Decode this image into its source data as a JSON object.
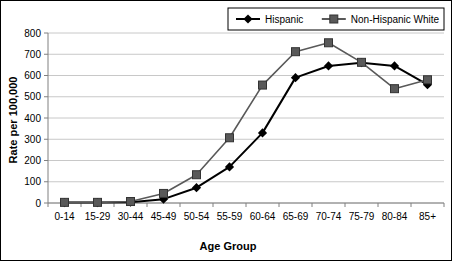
{
  "chart_data": {
    "type": "line",
    "title": "",
    "xlabel": "Age Group",
    "ylabel": "Rate per 100,000",
    "categories": [
      "0-14",
      "15-29",
      "30-44",
      "45-49",
      "50-54",
      "55-59",
      "60-64",
      "65-69",
      "70-74",
      "75-79",
      "80-84",
      "85+"
    ],
    "series": [
      {
        "name": "Hispanic",
        "marker": "diamond",
        "color": "#000000",
        "values": [
          2,
          2,
          4,
          18,
          72,
          170,
          330,
          590,
          645,
          660,
          645,
          557
        ]
      },
      {
        "name": "Non-Hispanic White",
        "marker": "square",
        "color": "#595959",
        "values": [
          3,
          3,
          7,
          45,
          133,
          307,
          555,
          712,
          754,
          662,
          538,
          580
        ]
      }
    ],
    "ylim": [
      0,
      800
    ],
    "ytick_step": 100,
    "yticks": [
      "0",
      "100",
      "200",
      "300",
      "400",
      "500",
      "600",
      "700",
      "800"
    ],
    "grid": "horizontal",
    "legend_position": "top-right"
  },
  "legend": {
    "entries": [
      {
        "label": "Hispanic"
      },
      {
        "label": "Non-Hispanic White"
      }
    ]
  },
  "axes": {
    "x_title": "Age Group",
    "y_title": "Rate per 100,000"
  },
  "colors": {
    "series_hispanic": "#000000",
    "series_nhwhite": "#595959",
    "grid": "#c8c8c8",
    "axis": "#808080",
    "frame": "#000000",
    "background": "#ffffff"
  }
}
